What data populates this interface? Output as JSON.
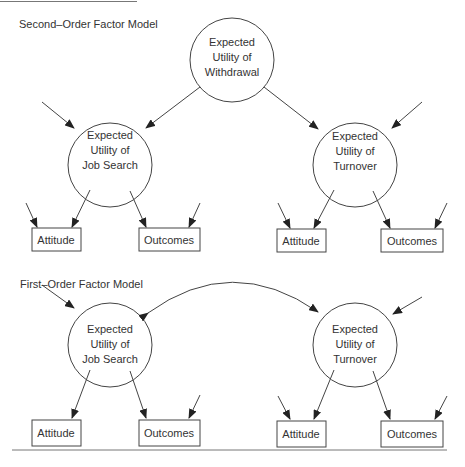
{
  "diagram": {
    "second_order": {
      "title": "Second–Order Factor Model",
      "top_node": {
        "lines": [
          "Expected",
          "Utility of",
          "Withdrawal"
        ]
      },
      "left_node": {
        "lines": [
          "Expected",
          "Utility of",
          "Job Search"
        ]
      },
      "right_node": {
        "lines": [
          "Expected",
          "Utility of",
          "Turnover"
        ]
      },
      "left_boxes": [
        "Attitude",
        "Outcomes"
      ],
      "right_boxes": [
        "Attitude",
        "Outcomes"
      ]
    },
    "first_order": {
      "title": "First–Order Factor Model",
      "left_node": {
        "lines": [
          "Expected",
          "Utility of",
          "Job Search"
        ]
      },
      "right_node": {
        "lines": [
          "Expected",
          "Utility of",
          "Turnover"
        ]
      },
      "left_boxes": [
        "Attitude",
        "Outcomes"
      ],
      "right_boxes": [
        "Attitude",
        "Outcomes"
      ],
      "correlation": "bidirectional curved arrow between Job Search and Turnover"
    }
  },
  "colors": {
    "stroke": "#444444",
    "text": "#333333",
    "background": "#ffffff"
  }
}
